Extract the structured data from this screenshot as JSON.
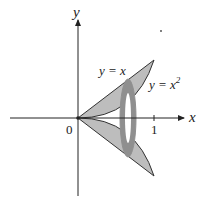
{
  "diagram": {
    "axes": {
      "x_label": "x",
      "y_label": "y",
      "origin_label": "0",
      "x_tick_label": "1"
    },
    "curves": [
      {
        "name": "line",
        "label": "y = x"
      },
      {
        "name": "parabola",
        "label": "y = x",
        "label_superscript": "2"
      }
    ],
    "colors": {
      "region_fill": "#b8b8b8",
      "washer_fill": "#8f8f8f",
      "axis": "#222222",
      "background": "#ffffff"
    }
  }
}
